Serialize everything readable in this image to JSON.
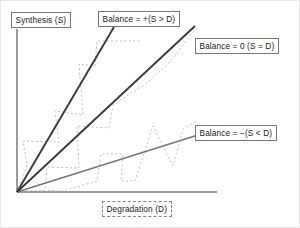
{
  "figure": {
    "type": "diagram",
    "background_color": "#ffffff"
  },
  "axes": {
    "y_axis": {
      "label": "Synthesis (S)",
      "name": "synthesis-axis",
      "orientation": "vertical",
      "color": "#888888"
    },
    "x_axis": {
      "label": "Degradation (D)",
      "name": "degradation-axis",
      "orientation": "horizontal",
      "color": "#999999"
    },
    "origin": {
      "x": 16,
      "y": 191
    }
  },
  "lines": [
    {
      "id": "positive-balance",
      "label": "Balance = +(S > D)",
      "description": "steep line, synthesis exceeds degradation",
      "color": "#3a3a3a",
      "width": 1.9,
      "from": {
        "x": 16,
        "y": 191
      },
      "to": {
        "x": 113,
        "y": 26
      }
    },
    {
      "id": "zero-balance",
      "label": "Balance = 0 (S = D)",
      "description": "unity slope line, synthesis equals degradation",
      "color": "#3a3a3a",
      "width": 1.9,
      "from": {
        "x": 16,
        "y": 191
      },
      "to": {
        "x": 194,
        "y": 25
      }
    },
    {
      "id": "negative-balance",
      "label": "Balance = −(S < D)",
      "description": "shallow line, degradation exceeds synthesis",
      "color": "#777777",
      "width": 1.6,
      "from": {
        "x": 16,
        "y": 191
      },
      "to": {
        "x": 197,
        "y": 134
      }
    }
  ],
  "traces": [
    {
      "id": "trace-upper",
      "style": "dotted",
      "color": "#c0c0c0",
      "points": "16,191 26,165 22,140 58,141 54,110 82,114 78,63 94,65 96,40 140,40"
    },
    {
      "id": "trace-middle",
      "style": "dotted",
      "color": "#c2c2c2",
      "points": "16,191 44,190 46,166 78,167 76,125 108,127 112,104 146,82 170,60 190,33 198,26"
    },
    {
      "id": "trace-lower",
      "style": "dotted",
      "color": "#c4c4c4",
      "points": "16,191 38,189 62,190 96,180 100,153 122,153 120,180 134,180 152,125 172,165 182,128 196,120"
    }
  ],
  "labels": {
    "synthesis": "Synthesis (S)",
    "positive": "Balance = +(S > D)",
    "zero": "Balance = 0 (S = D)",
    "negative": "Balance = −(S < D)",
    "degradation": "Degradation (D)"
  },
  "colors": {
    "line_dark": "#3a3a3a",
    "line_gray": "#777777",
    "trace_gray": "#c2c2c2",
    "axis": "#8f8f8f",
    "box_border": "#777777",
    "text": "#1a1a1a"
  }
}
